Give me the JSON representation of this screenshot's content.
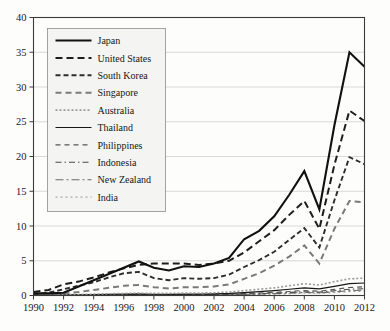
{
  "chart_data": {
    "type": "line",
    "title": "",
    "xlabel": "",
    "ylabel": "",
    "xlim": [
      1990,
      2012
    ],
    "ylim": [
      0,
      40
    ],
    "ytick_step": 5,
    "xtick_step": 2,
    "grid": true,
    "legend_position": "top-left-inside",
    "x": [
      1990,
      1991,
      1992,
      1993,
      1994,
      1995,
      1996,
      1997,
      1998,
      1999,
      2000,
      2001,
      2002,
      2003,
      2004,
      2005,
      2006,
      2007,
      2008,
      2009,
      2010,
      2011,
      2012
    ],
    "xtick_labels": [
      "1990",
      "1992",
      "1994",
      "1996",
      "1998",
      "2000",
      "2002",
      "2004",
      "2006",
      "2008",
      "2010",
      "2012"
    ],
    "ytick_labels": [
      "0",
      "5",
      "10",
      "15",
      "20",
      "25",
      "30",
      "35",
      "40"
    ],
    "series": [
      {
        "name": "Japan",
        "dash": "none",
        "color": "#111111",
        "width": 2.1,
        "values": [
          0.3,
          0.3,
          0.4,
          1.3,
          2.2,
          3.1,
          4.0,
          4.9,
          4.0,
          3.6,
          4.2,
          4.1,
          4.6,
          5.4,
          8.1,
          9.3,
          11.4,
          14.5,
          17.9,
          12.4,
          24.5,
          35.0,
          32.9
        ]
      },
      {
        "name": "United States",
        "dash": "7,4",
        "color": "#1d1d1d",
        "width": 2.0,
        "values": [
          0.5,
          0.8,
          1.6,
          2.0,
          2.6,
          3.3,
          3.9,
          4.4,
          4.6,
          4.6,
          4.6,
          4.4,
          4.6,
          5.0,
          6.2,
          7.8,
          9.4,
          11.6,
          13.6,
          9.6,
          18.8,
          26.6,
          25.1
        ]
      },
      {
        "name": "South Korea",
        "dash": "5,3",
        "color": "#2d2d2d",
        "width": 1.9,
        "values": [
          0.2,
          0.4,
          0.9,
          1.4,
          1.9,
          2.6,
          3.2,
          3.4,
          2.5,
          2.2,
          2.5,
          2.4,
          2.5,
          3.0,
          4.1,
          5.1,
          6.3,
          8.0,
          9.7,
          6.9,
          13.7,
          19.9,
          18.9
        ]
      },
      {
        "name": "Singapore",
        "dash": "6,4",
        "color": "#7a7a7a",
        "width": 2.0,
        "values": [
          0.1,
          0.2,
          0.3,
          0.5,
          0.8,
          1.1,
          1.4,
          1.5,
          1.2,
          1.0,
          1.2,
          1.2,
          1.3,
          1.6,
          2.4,
          3.2,
          4.3,
          5.6,
          7.2,
          4.6,
          9.6,
          13.6,
          13.4
        ]
      },
      {
        "name": "Australia",
        "dash": "2,2",
        "color": "#9a9a9a",
        "width": 1.6,
        "values": [
          0.05,
          0.08,
          0.1,
          0.15,
          0.2,
          0.25,
          0.3,
          0.35,
          0.3,
          0.3,
          0.35,
          0.35,
          0.4,
          0.5,
          0.7,
          0.9,
          1.1,
          1.4,
          1.7,
          1.5,
          2.0,
          2.4,
          2.5
        ]
      },
      {
        "name": "Thailand",
        "dash": "none",
        "color": "#161616",
        "width": 1.2,
        "values": [
          0.05,
          0.06,
          0.08,
          0.1,
          0.13,
          0.16,
          0.2,
          0.22,
          0.18,
          0.17,
          0.2,
          0.2,
          0.24,
          0.3,
          0.42,
          0.55,
          0.7,
          0.9,
          1.1,
          0.95,
          1.3,
          1.7,
          1.8
        ]
      },
      {
        "name": "Philippines",
        "dash": "5,4",
        "color": "#555555",
        "width": 1.1,
        "values": [
          0.03,
          0.04,
          0.05,
          0.07,
          0.09,
          0.11,
          0.13,
          0.15,
          0.12,
          0.11,
          0.13,
          0.13,
          0.16,
          0.2,
          0.28,
          0.36,
          0.46,
          0.58,
          0.72,
          0.62,
          0.88,
          1.15,
          1.25
        ]
      },
      {
        "name": "Indonesia",
        "dash": "6,3,1.5,3",
        "color": "#4a4a4a",
        "width": 1.1,
        "values": [
          0.02,
          0.03,
          0.04,
          0.05,
          0.07,
          0.08,
          0.1,
          0.11,
          0.09,
          0.08,
          0.1,
          0.1,
          0.12,
          0.15,
          0.21,
          0.27,
          0.35,
          0.44,
          0.55,
          0.48,
          0.68,
          0.9,
          0.98
        ]
      },
      {
        "name": "New Zealand",
        "dash": "8,3,2,3",
        "color": "#6a6a6a",
        "width": 1.1,
        "values": [
          0.02,
          0.02,
          0.03,
          0.04,
          0.05,
          0.06,
          0.07,
          0.08,
          0.07,
          0.06,
          0.07,
          0.08,
          0.09,
          0.11,
          0.16,
          0.21,
          0.27,
          0.34,
          0.43,
          0.38,
          0.53,
          0.7,
          0.76
        ]
      },
      {
        "name": "India",
        "dash": "2,3",
        "color": "#a6a6a6",
        "width": 1.2,
        "values": [
          0.01,
          0.01,
          0.02,
          0.02,
          0.03,
          0.04,
          0.05,
          0.05,
          0.05,
          0.04,
          0.05,
          0.05,
          0.06,
          0.08,
          0.11,
          0.15,
          0.2,
          0.26,
          0.33,
          0.3,
          0.42,
          0.56,
          0.62
        ]
      }
    ]
  }
}
